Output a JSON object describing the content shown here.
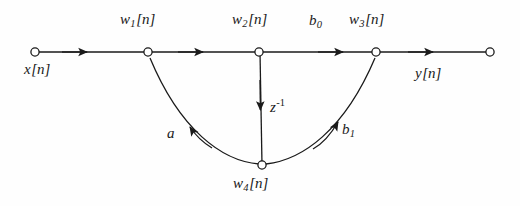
{
  "figure": {
    "type": "signal-flow-graph",
    "background_color": "#fefefe",
    "line_color": "#1a1a1a",
    "node_fill": "#ffffff",
    "width": 520,
    "height": 206
  },
  "nodes": [
    {
      "id": "x",
      "label_base": "x",
      "label_sub": "",
      "label_suffix": "[n]",
      "x": 35,
      "y": 52,
      "label_x": 24,
      "label_y": 62
    },
    {
      "id": "w1",
      "label_base": "w",
      "label_sub": "1",
      "label_suffix": "[n]",
      "x": 148,
      "y": 52,
      "label_x": 120,
      "label_y": 12
    },
    {
      "id": "w2",
      "label_base": "w",
      "label_sub": "2",
      "label_suffix": "[n]",
      "x": 259,
      "y": 52,
      "label_x": 232,
      "label_y": 12
    },
    {
      "id": "w3",
      "label_base": "w",
      "label_sub": "3",
      "label_suffix": "[n]",
      "x": 376,
      "y": 52,
      "label_x": 349,
      "label_y": 12
    },
    {
      "id": "y",
      "label_base": "y",
      "label_sub": "",
      "label_suffix": "[n]",
      "x": 490,
      "y": 52,
      "label_x": 415,
      "label_y": 66
    },
    {
      "id": "w4",
      "label_base": "w",
      "label_sub": "4",
      "label_suffix": "[n]",
      "x": 262,
      "y": 165,
      "label_x": 233,
      "label_y": 176
    }
  ],
  "branch_labels": [
    {
      "id": "b0",
      "base": "b",
      "sub": "0",
      "sup": "",
      "x": 309,
      "y": 13
    },
    {
      "id": "zinv",
      "base": "z",
      "sub": "",
      "sup": "-1",
      "x": 270,
      "y": 98
    },
    {
      "id": "a",
      "base": "a",
      "sub": "",
      "sup": "",
      "x": 167,
      "y": 126
    },
    {
      "id": "b1",
      "base": "b",
      "sub": "1",
      "sup": "",
      "x": 342,
      "y": 122
    }
  ],
  "edges": [
    {
      "id": "x-to-w1",
      "from": "x",
      "to": "w1",
      "shape": "straight",
      "arrow_at": 85,
      "gain": ""
    },
    {
      "id": "w1-to-w2",
      "from": "w1",
      "to": "w2",
      "shape": "straight",
      "arrow_at": 201,
      "gain": ""
    },
    {
      "id": "w2-to-w3",
      "from": "w2",
      "to": "w3",
      "shape": "straight",
      "arrow_at": 341,
      "gain": "b0"
    },
    {
      "id": "w3-to-y",
      "from": "w3",
      "to": "y",
      "shape": "straight",
      "arrow_at": 431,
      "gain": ""
    },
    {
      "id": "w2-to-w4",
      "from": "w2",
      "to": "w4",
      "shape": "vertical",
      "arrow_at": 108,
      "gain": "zinv"
    },
    {
      "id": "w4-to-w1",
      "from": "w4",
      "to": "w1",
      "shape": "curve-left",
      "gain": "a"
    },
    {
      "id": "w4-to-w3",
      "from": "w4",
      "to": "w3",
      "shape": "curve-right",
      "gain": "b1"
    }
  ]
}
